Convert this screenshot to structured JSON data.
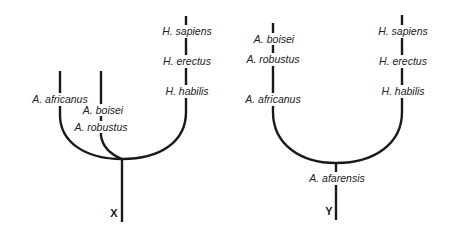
{
  "diagram": {
    "type": "phylogenetic-trees",
    "colors": {
      "line": "#1a1a1a",
      "text": "#222222",
      "background": "#ffffff"
    },
    "tree_x": {
      "label": "X",
      "species": {
        "h_sapiens": "H. sapiens",
        "h_erectus": "H. erectus",
        "h_habilis": "H. habilis",
        "a_africanus": "A. africanus",
        "a_boisei": "A. boisei",
        "a_robustus": "A. robustus"
      }
    },
    "tree_y": {
      "label": "Y",
      "species": {
        "a_boisei": "A. boisei",
        "a_robustus": "A. robustus",
        "a_africanus": "A. africanus",
        "h_sapiens": "H. sapiens",
        "h_erectus": "H. erectus",
        "h_habilis": "H. habilis",
        "a_afarensis": "A. afarensis"
      }
    }
  }
}
